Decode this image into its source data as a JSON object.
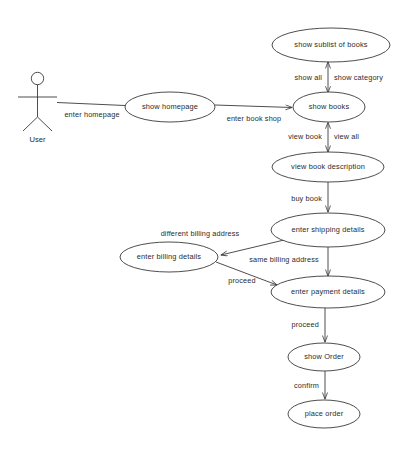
{
  "diagram": {
    "type": "uml-use-case",
    "background_color": "#ffffff",
    "stroke_color": "#3a3a3a",
    "text_color": "#2b2b2b",
    "actors": [
      {
        "id": "user",
        "label": "User"
      }
    ],
    "use_cases": [
      {
        "id": "show-sublist-of-books",
        "label": "show sublist of books",
        "cx": 331,
        "cy": 45,
        "rx": 59,
        "ry": 17
      },
      {
        "id": "show-homepage",
        "label": "show homepage",
        "cx": 170,
        "cy": 107,
        "rx": 45,
        "ry": 15
      },
      {
        "id": "show-books",
        "label": "show books",
        "cx": 329,
        "cy": 107,
        "rx": 36,
        "ry": 15
      },
      {
        "id": "view-book-description",
        "label": "view book description",
        "cx": 328,
        "cy": 167,
        "rx": 56,
        "ry": 15
      },
      {
        "id": "enter-shipping-details",
        "label": "enter shipping details",
        "cx": 328,
        "cy": 230,
        "rx": 57,
        "ry": 17
      },
      {
        "id": "enter-billing-details",
        "label": "enter billing details",
        "cx": 169,
        "cy": 257,
        "rx": 49,
        "ry": 15
      },
      {
        "id": "enter-payment-details",
        "label": "enter payment details",
        "cx": 328,
        "cy": 292,
        "rx": 57,
        "ry": 16
      },
      {
        "id": "show-order",
        "label": "show Order",
        "cx": 324,
        "cy": 357,
        "rx": 36,
        "ry": 14
      },
      {
        "id": "place-order",
        "label": "place order",
        "cx": 324,
        "cy": 414,
        "rx": 36,
        "ry": 14
      }
    ],
    "edges": [
      {
        "id": "enter-homepage",
        "label": "enter homepage",
        "from": "user",
        "to": "show-homepage",
        "arrow": "none"
      },
      {
        "id": "enter-book-shop",
        "label": "enter book shop",
        "from": "show-homepage",
        "to": "show-books",
        "arrow": "end"
      },
      {
        "id": "show-all",
        "label": "show all",
        "from": "show-books",
        "to": "show-sublist-of-books",
        "arrow": "both"
      },
      {
        "id": "show-category",
        "label": "show category",
        "from": "show-sublist-of-books",
        "to": "show-books",
        "arrow": "both"
      },
      {
        "id": "view-book",
        "label": "view book",
        "from": "show-books",
        "to": "view-book-description",
        "arrow": "both"
      },
      {
        "id": "view-all",
        "label": "view all",
        "from": "view-book-description",
        "to": "show-books",
        "arrow": "both"
      },
      {
        "id": "buy-book",
        "label": "buy book",
        "from": "view-book-description",
        "to": "enter-shipping-details",
        "arrow": "end"
      },
      {
        "id": "different-billing-address",
        "label": "different billing address",
        "from": "enter-shipping-details",
        "to": "enter-billing-details",
        "arrow": "end"
      },
      {
        "id": "same-billing-address",
        "label": "same billing address",
        "from": "enter-shipping-details",
        "to": "enter-payment-details",
        "arrow": "end"
      },
      {
        "id": "proceed-billing",
        "label": "proceed",
        "from": "enter-billing-details",
        "to": "enter-payment-details",
        "arrow": "end"
      },
      {
        "id": "proceed-payment",
        "label": "proceed",
        "from": "enter-payment-details",
        "to": "show-order",
        "arrow": "end"
      },
      {
        "id": "confirm",
        "label": "confirm",
        "from": "show-order",
        "to": "place-order",
        "arrow": "end"
      }
    ]
  }
}
